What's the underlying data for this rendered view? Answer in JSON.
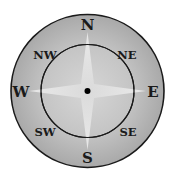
{
  "compass": {
    "cardinal": {
      "n": "N",
      "e": "E",
      "s": "S",
      "w": "W"
    },
    "intercardinal": {
      "ne": "NE",
      "nw": "NW",
      "se": "SE",
      "sw": "SW"
    },
    "colors": {
      "outer_ring": "#b3b3b3",
      "inner_disc": "#c9c9c9",
      "star": "#f2f2f2",
      "lines": "#1a1a1a",
      "center_dot": "#000000"
    }
  }
}
